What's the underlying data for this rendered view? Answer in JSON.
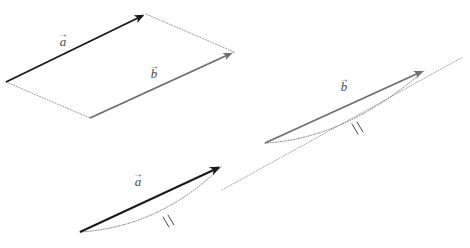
{
  "figure": {
    "background_color": "#ffffff",
    "width": 470,
    "height": 248,
    "colors": {
      "vector_a_stroke": "#1a1a1a",
      "vector_b_stroke": "#6e6e6e",
      "construction_line": "#9a9a9a",
      "label_text": "#4a4a4a"
    },
    "panels": [
      {
        "id": "parallelogram-panel",
        "name": "left-parallelogram-figure",
        "description": "Two vectors from a common origin with dotted lines completing a parallelogram",
        "origin": [
          6,
          82
        ],
        "vectors": [
          {
            "name": "a",
            "label": "a",
            "accent": "→",
            "style": "solid",
            "color": "#1a1a1a",
            "tail": [
              6,
              82
            ],
            "head": [
              146,
              14
            ],
            "arrowhead": true
          },
          {
            "name": "b",
            "label": "b",
            "accent": "→",
            "style": "solid",
            "color": "#6e6e6e",
            "tail": [
              90,
              118
            ],
            "head": [
              234,
              52
            ],
            "arrowhead": true
          }
        ],
        "construction_lines": [
          {
            "from": [
              6,
              82
            ],
            "to": [
              90,
              118
            ],
            "style": "dotted"
          },
          {
            "from": [
              146,
              14
            ],
            "to": [
              234,
              52
            ],
            "style": "dotted"
          }
        ]
      },
      {
        "id": "collinear-panel",
        "name": "right-collinear-figure",
        "description": "Two parallel vectors lying along a common dotted straight line, each paired with a dotted arc marked by double tick marks",
        "baseline": {
          "from": [
            222,
            190
          ],
          "to": [
            463,
            57
          ],
          "style": "dotted"
        },
        "vectors": [
          {
            "name": "a",
            "label": "a",
            "accent": "→",
            "style": "solid",
            "color": "#1a1a1a",
            "tail": [
              80,
              232
            ],
            "head": [
              222,
              166
            ],
            "arrowhead": true,
            "arc": {
              "style": "dotted",
              "tick_marks": 2,
              "tick_label": "‖"
            }
          },
          {
            "name": "b",
            "label": "b",
            "accent": "→",
            "style": "solid",
            "color": "#6e6e6e",
            "tail": [
              265,
              143
            ],
            "head": [
              425,
              70
            ],
            "arrowhead": true,
            "arc": {
              "style": "dotted",
              "tick_marks": 2,
              "tick_label": "‖"
            }
          }
        ]
      }
    ],
    "labels": {
      "a_left": {
        "glyph": "a",
        "accent": "→"
      },
      "b_left": {
        "glyph": "b",
        "accent": "→"
      },
      "a_right": {
        "glyph": "a",
        "accent": "→"
      },
      "b_right": {
        "glyph": "b",
        "accent": "→"
      }
    }
  }
}
